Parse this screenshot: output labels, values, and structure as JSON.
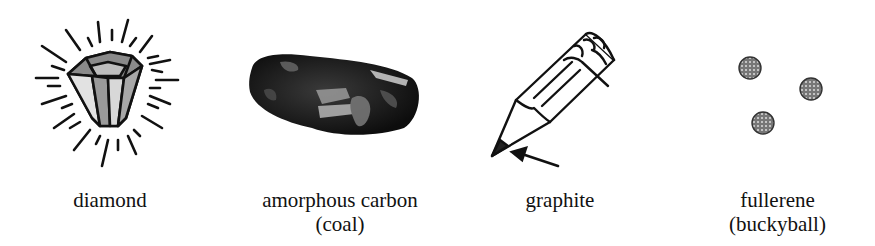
{
  "figure": {
    "items": [
      {
        "id": "diamond",
        "label": "diamond",
        "icon": "diamond-icon"
      },
      {
        "id": "amorphous-carbon",
        "label": "amorphous carbon",
        "sublabel": "(coal)",
        "icon": "coal-icon"
      },
      {
        "id": "graphite",
        "label": "graphite",
        "icon": "pencil-icon"
      },
      {
        "id": "fullerene",
        "label": "fullerene",
        "sublabel": "(buckyball)",
        "icon": "buckyball-icon"
      }
    ]
  }
}
